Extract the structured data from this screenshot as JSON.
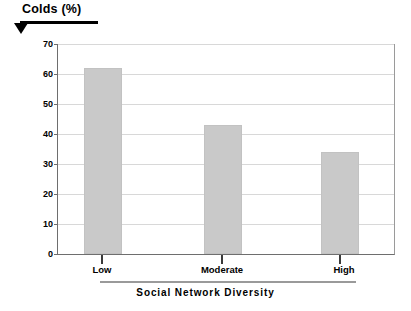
{
  "chart_data": {
    "type": "bar",
    "title": "Colds (%)",
    "xlabel": "Social Network Diversity",
    "ylabel": "Colds (%)",
    "categories": [
      "Low",
      "Moderate",
      "High"
    ],
    "values": [
      62,
      43,
      34
    ],
    "series": [
      {
        "name": "Colds (%)",
        "values": [
          62,
          43,
          34
        ]
      }
    ],
    "ylim": [
      0,
      70
    ],
    "ytick_step": 10,
    "yticks": [
      70,
      60,
      50,
      40,
      30,
      20,
      10,
      0
    ],
    "ytick_labels": [
      "70",
      "60",
      "50",
      "40",
      "30",
      "20",
      "10",
      "0"
    ],
    "grid": "horizontal",
    "legend": "none",
    "bar_color": "#c9c9c9",
    "grid_color": "#d8d8d8",
    "axis_color": "#6e6e6e",
    "text_color": "#000000",
    "background": "#ffffff"
  },
  "annotations": {
    "title_arrow_icon": "triangle-down-icon",
    "title_rule": "black-underline-rule",
    "xaxis_rule": "gray-bracket-rule"
  }
}
